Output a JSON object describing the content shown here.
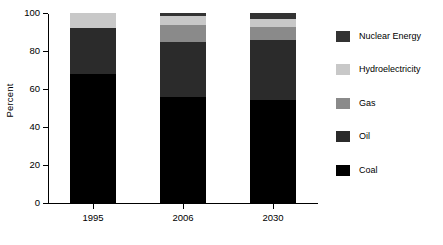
{
  "chart_data": {
    "type": "bar",
    "stacked": true,
    "title": "",
    "xlabel": "",
    "ylabel": "Percent",
    "categories": [
      "1995",
      "2006",
      "2030"
    ],
    "ylim": [
      0,
      100
    ],
    "yticks": [
      0,
      20,
      40,
      60,
      80,
      100
    ],
    "grid": false,
    "legend_position": "right",
    "series": [
      {
        "name": "Coal",
        "color": "#000000",
        "values": [
          68,
          56,
          54
        ]
      },
      {
        "name": "Oil",
        "color": "#2b2b2b",
        "values": [
          24,
          29,
          32
        ]
      },
      {
        "name": "Gas",
        "color": "#8a8a8a",
        "values": [
          0,
          8.5,
          6.5
        ]
      },
      {
        "name": "Hydroelectricity",
        "color": "#c8c8c8",
        "values": [
          8,
          5,
          4.5
        ]
      },
      {
        "name": "Nuclear Energy",
        "color": "#333333",
        "values": [
          0,
          1.5,
          3
        ]
      }
    ],
    "legend_order": [
      "Nuclear Energy",
      "Hydroelectricity",
      "Gas",
      "Oil",
      "Coal"
    ]
  },
  "axes": {
    "y_title": "Percent",
    "y_tick_labels": [
      "0",
      "20",
      "40",
      "60",
      "80",
      "100"
    ],
    "x_tick_labels": [
      "1995",
      "2006",
      "2030"
    ]
  },
  "legend": {
    "items": [
      {
        "label": "Nuclear Energy",
        "color": "#333333"
      },
      {
        "label": "Hydroelectricity",
        "color": "#c8c8c8"
      },
      {
        "label": "Gas",
        "color": "#8a8a8a"
      },
      {
        "label": "Oil",
        "color": "#2b2b2b"
      },
      {
        "label": "Coal",
        "color": "#000000"
      }
    ]
  }
}
